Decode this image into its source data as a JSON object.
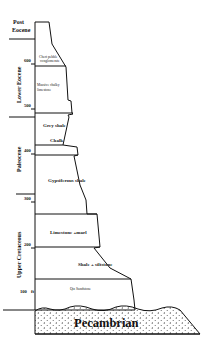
{
  "diagram": {
    "type": "stratigraphic-column",
    "epochs": [
      {
        "label_line1": "Post",
        "label_line2": "Eocene"
      },
      {
        "label": "Lower Eocene"
      },
      {
        "label": "Paleocene"
      },
      {
        "label": "Upper Cretaceous"
      }
    ],
    "depth_ticks": [
      {
        "value": "600"
      },
      {
        "value": "500"
      },
      {
        "value": "400"
      },
      {
        "value": "300"
      },
      {
        "value": "200"
      },
      {
        "value": "100"
      }
    ],
    "depth_unit": "ft",
    "layers": [
      {
        "line1": "Chert pebble",
        "line2": "conglomerate"
      },
      {
        "line1": "Massive chalky",
        "line2": "limestone"
      },
      {
        "label": "Grey shale"
      },
      {
        "label": "Chalk"
      },
      {
        "label": "Gypsiferous shale"
      },
      {
        "label": "Limestone +marl"
      },
      {
        "label": "Shale + siltstone"
      },
      {
        "label": "Qtz Sandstone"
      }
    ],
    "basement": {
      "label": "Pecambrian"
    },
    "colors": {
      "line": "#111111",
      "background": "#ffffff",
      "pattern": "#333333"
    }
  }
}
